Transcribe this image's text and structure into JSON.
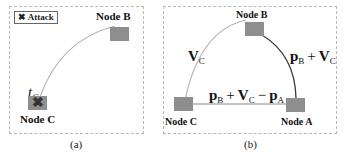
{
  "panel_a": {
    "legend_label": "Attack",
    "legend_icon": "x-mark-icon",
    "node_b_label": "Node  B",
    "node_c_label": "Node  C",
    "time_label": "t",
    "time_sub": "C",
    "caption": "(a)"
  },
  "panel_b": {
    "node_a_label": "Node  A",
    "node_b_label": "Node  B",
    "node_c_label": "Node  C",
    "edge_cb_label": "V",
    "edge_cb_sub": "C",
    "edge_ba_p": "p",
    "edge_ba_p_sub": "B",
    "edge_ba_plus": "+",
    "edge_ba_v": "V",
    "edge_ba_v_sub": "C",
    "edge_ca_p1": "p",
    "edge_ca_p1_sub": "B",
    "edge_ca_plus": "+",
    "edge_ca_v": "V",
    "edge_ca_v_sub": "C",
    "edge_ca_minus": "−",
    "edge_ca_p2": "p",
    "edge_ca_p2_sub": "A",
    "caption": "(b)"
  },
  "colors": {
    "node_fill": "#8e8e8e",
    "edge_light": "#b5b5b5",
    "edge_dark": "#3a3a3a",
    "frame": "#b8b8b8"
  }
}
